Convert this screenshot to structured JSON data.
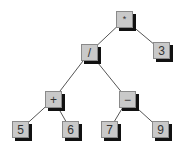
{
  "diagram": {
    "type": "expression-tree",
    "colors": {
      "node_fill": "#c9c9c9",
      "node_border": "#8a8a8a",
      "node_shadow": "#111111",
      "edge": "#555555",
      "text": "#333333",
      "background": "#ffffff"
    },
    "nodes": [
      {
        "id": "n-mul",
        "label": "*",
        "kind": "operator",
        "x": 116,
        "y": 11
      },
      {
        "id": "n-3",
        "label": "3",
        "kind": "operand",
        "x": 153,
        "y": 42
      },
      {
        "id": "n-div",
        "label": "/",
        "kind": "operator",
        "x": 81,
        "y": 44
      },
      {
        "id": "n-plus",
        "label": "+",
        "kind": "operator",
        "x": 45,
        "y": 91
      },
      {
        "id": "n-minus",
        "label": "−",
        "kind": "operator",
        "x": 119,
        "y": 91
      },
      {
        "id": "n-5",
        "label": "5",
        "kind": "operand",
        "x": 12,
        "y": 121
      },
      {
        "id": "n-6",
        "label": "6",
        "kind": "operand",
        "x": 62,
        "y": 121
      },
      {
        "id": "n-7",
        "label": "7",
        "kind": "operand",
        "x": 101,
        "y": 121
      },
      {
        "id": "n-9",
        "label": "9",
        "kind": "operand",
        "x": 152,
        "y": 121
      }
    ],
    "edges": [
      {
        "from": "n-mul",
        "to": "n-div"
      },
      {
        "from": "n-mul",
        "to": "n-3"
      },
      {
        "from": "n-div",
        "to": "n-plus"
      },
      {
        "from": "n-div",
        "to": "n-minus"
      },
      {
        "from": "n-plus",
        "to": "n-5"
      },
      {
        "from": "n-plus",
        "to": "n-6"
      },
      {
        "from": "n-minus",
        "to": "n-7"
      },
      {
        "from": "n-minus",
        "to": "n-9"
      }
    ]
  }
}
